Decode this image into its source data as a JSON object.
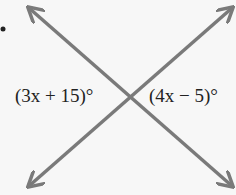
{
  "diagram": {
    "angle_left": "(3x + 15)°",
    "angle_right": "(4x − 5)°",
    "line_color": "#7a7a7a",
    "text_color": "#222222"
  }
}
